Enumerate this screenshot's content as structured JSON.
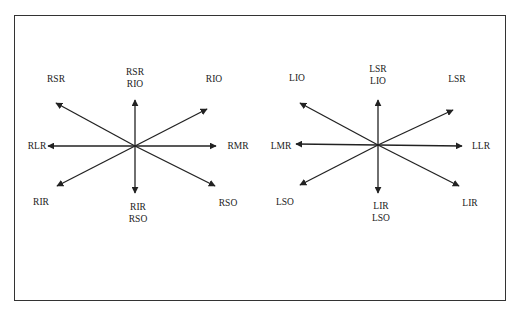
{
  "diagram": {
    "type": "extraocular-muscle-action-diagram",
    "colors": {
      "line": "#222222",
      "frame": "#333333",
      "text": "#222222"
    },
    "stars": [
      {
        "name": "right-eye",
        "center": [
          135,
          146
        ],
        "arrows": [
          {
            "dir": "up",
            "end": [
              135,
              100
            ]
          },
          {
            "dir": "down",
            "end": [
              135,
              193
            ]
          },
          {
            "dir": "left",
            "end": [
              48,
              146
            ]
          },
          {
            "dir": "right",
            "end": [
              216,
              146
            ]
          },
          {
            "dir": "up-left",
            "end": [
              56,
              103
            ]
          },
          {
            "dir": "up-right",
            "end": [
              207,
              109
            ]
          },
          {
            "dir": "down-left",
            "end": [
              57,
              186
            ]
          },
          {
            "dir": "down-right",
            "end": [
              215,
              186
            ]
          }
        ],
        "labels": [
          {
            "id": "up-left",
            "lines": [
              "RSR"
            ],
            "pos": [
              56,
              79
            ]
          },
          {
            "id": "up",
            "lines": [
              "RSR",
              "RIO"
            ],
            "pos": [
              135,
              78
            ]
          },
          {
            "id": "up-right",
            "lines": [
              "RIO"
            ],
            "pos": [
              214,
              79
            ]
          },
          {
            "id": "left",
            "lines": [
              "RLR"
            ],
            "pos": [
              37,
              146
            ]
          },
          {
            "id": "right",
            "lines": [
              "RMR"
            ],
            "pos": [
              238,
              146
            ]
          },
          {
            "id": "down-left",
            "lines": [
              "RIR"
            ],
            "pos": [
              41,
              202
            ]
          },
          {
            "id": "down",
            "lines": [
              "RIR",
              "RSO"
            ],
            "pos": [
              138,
              213
            ]
          },
          {
            "id": "down-right",
            "lines": [
              "RSO"
            ],
            "pos": [
              228,
              203
            ]
          }
        ]
      },
      {
        "name": "left-eye",
        "center": [
          378,
          145
        ],
        "arrows": [
          {
            "dir": "up",
            "end": [
              378,
              100
            ]
          },
          {
            "dir": "down",
            "end": [
              378,
              193
            ]
          },
          {
            "dir": "left",
            "end": [
              296,
              144
            ]
          },
          {
            "dir": "right",
            "end": [
              462,
              146
            ]
          },
          {
            "dir": "up-left",
            "end": [
              300,
              103
            ]
          },
          {
            "dir": "up-right",
            "end": [
              453,
              110
            ]
          },
          {
            "dir": "down-left",
            "end": [
              300,
              185
            ]
          },
          {
            "dir": "down-right",
            "end": [
              459,
              186
            ]
          }
        ],
        "labels": [
          {
            "id": "up-left",
            "lines": [
              "LIO"
            ],
            "pos": [
              297,
              78
            ]
          },
          {
            "id": "up",
            "lines": [
              "LSR",
              "LIO"
            ],
            "pos": [
              378,
              75
            ]
          },
          {
            "id": "up-right",
            "lines": [
              "LSR"
            ],
            "pos": [
              457,
              79
            ]
          },
          {
            "id": "left",
            "lines": [
              "LMR"
            ],
            "pos": [
              281,
              146
            ]
          },
          {
            "id": "right",
            "lines": [
              "LLR"
            ],
            "pos": [
              481,
              146
            ]
          },
          {
            "id": "down-left",
            "lines": [
              "LSO"
            ],
            "pos": [
              285,
              202
            ]
          },
          {
            "id": "down",
            "lines": [
              "LIR",
              "LSO"
            ],
            "pos": [
              381,
              212
            ]
          },
          {
            "id": "down-right",
            "lines": [
              "LIR"
            ],
            "pos": [
              470,
              203
            ]
          }
        ]
      }
    ]
  }
}
